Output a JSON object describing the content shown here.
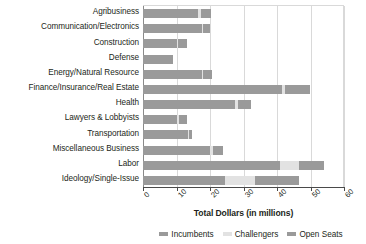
{
  "chart_data": {
    "type": "bar",
    "orientation": "horizontal",
    "stacked": true,
    "title": "",
    "xlabel": "Total Dollars (in millions)",
    "ylabel": "",
    "xlim": [
      0,
      60
    ],
    "xticks": [
      0,
      10,
      20,
      30,
      40,
      50,
      60
    ],
    "grid": true,
    "legend_position": "bottom",
    "categories": [
      "Agribusiness",
      "Communication/Electronics",
      "Construction",
      "Defense",
      "Energy/Natural Resource",
      "Finance/Insurance/Real Estate",
      "Health",
      "Lawyers & Lobbyists",
      "Transportation",
      "Miscellaneous Business",
      "Labor",
      "Ideology/Single-Issue"
    ],
    "series": [
      {
        "name": "Incumbents",
        "color": "#9a9a9a",
        "values": [
          16.5,
          17.5,
          10.0,
          9.0,
          17.5,
          41.5,
          27.5,
          10.0,
          13.5,
          20.0,
          41.0,
          24.5
        ]
      },
      {
        "name": "Challengers",
        "color": "#e2e2e2",
        "values": [
          0.8,
          0.4,
          0.3,
          0.0,
          0.5,
          1.0,
          0.8,
          0.7,
          0.3,
          1.0,
          5.5,
          9.0
        ]
      },
      {
        "name": "Open Seats",
        "color": "#9a9a9a",
        "values": [
          3.0,
          2.0,
          2.8,
          0.0,
          2.5,
          7.5,
          4.0,
          2.5,
          0.8,
          3.0,
          7.5,
          13.0
        ]
      }
    ],
    "totals": [
      20.3,
      19.9,
      13.1,
      9.0,
      20.5,
      50.0,
      32.3,
      13.2,
      14.6,
      24.0,
      54.0,
      46.5
    ]
  },
  "axis": {
    "x_title": "Total Dollars (in millions)",
    "tick_labels": [
      "0",
      "10",
      "20",
      "30",
      "40",
      "50",
      "60"
    ]
  },
  "legend": {
    "items": [
      {
        "label": "Incumbents",
        "color": "#9a9a9a"
      },
      {
        "label": "Challengers",
        "color": "#e2e2e2"
      },
      {
        "label": "Open Seats",
        "color": "#9a9a9a"
      }
    ]
  }
}
